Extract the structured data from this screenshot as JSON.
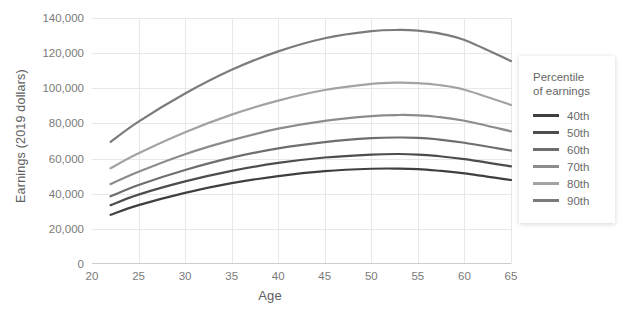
{
  "chart_data": {
    "type": "line",
    "title": "",
    "xlabel": "Age",
    "ylabel": "Earnings (2019 dollars)",
    "xlim": [
      20,
      65
    ],
    "ylim": [
      0,
      140000
    ],
    "xticks": [
      20,
      25,
      30,
      35,
      40,
      45,
      50,
      55,
      60,
      65
    ],
    "yticks": [
      0,
      20000,
      40000,
      60000,
      80000,
      100000,
      120000,
      140000
    ],
    "ytick_labels": [
      "0",
      "20,000",
      "40,000",
      "60,000",
      "80,000",
      "100,000",
      "120,000",
      "140,000"
    ],
    "xtick_labels": [
      "20",
      "25",
      "30",
      "35",
      "40",
      "45",
      "50",
      "55",
      "60",
      "65"
    ],
    "grid": true,
    "legend_position": "right",
    "legend_title": "Percentile of earnings",
    "x": [
      22,
      25,
      30,
      35,
      40,
      45,
      50,
      53,
      55,
      57,
      60,
      65
    ],
    "series": [
      {
        "name": "40th",
        "color": "#3f3f3f",
        "values": [
          28000,
          33500,
          40500,
          46000,
          50000,
          52800,
          54200,
          54300,
          54000,
          53200,
          51600,
          47800
        ]
      },
      {
        "name": "50th",
        "color": "#4d4d4d",
        "values": [
          33500,
          39500,
          47000,
          53000,
          57500,
          60600,
          62300,
          62600,
          62300,
          61500,
          59700,
          55600
        ]
      },
      {
        "name": "60th",
        "color": "#6e6e6e",
        "values": [
          38500,
          45000,
          53500,
          60500,
          65800,
          69400,
          71600,
          72000,
          71800,
          71000,
          69000,
          64500
        ]
      },
      {
        "name": "70th",
        "color": "#8c8c8c",
        "values": [
          45500,
          52500,
          62500,
          70500,
          77000,
          81500,
          84200,
          84800,
          84600,
          83800,
          81500,
          75500
        ]
      },
      {
        "name": "80th",
        "color": "#a3a3a3",
        "values": [
          54500,
          63000,
          75000,
          85000,
          93000,
          99000,
          102500,
          103200,
          102900,
          102000,
          99200,
          90500
        ]
      },
      {
        "name": "90th",
        "color": "#7b7b7b",
        "values": [
          69500,
          81000,
          97000,
          110500,
          121000,
          128500,
          132500,
          133200,
          132800,
          131500,
          127500,
          115500
        ]
      }
    ]
  },
  "legend": {
    "title_line1": "Percentile",
    "title_line2": "of earnings"
  }
}
